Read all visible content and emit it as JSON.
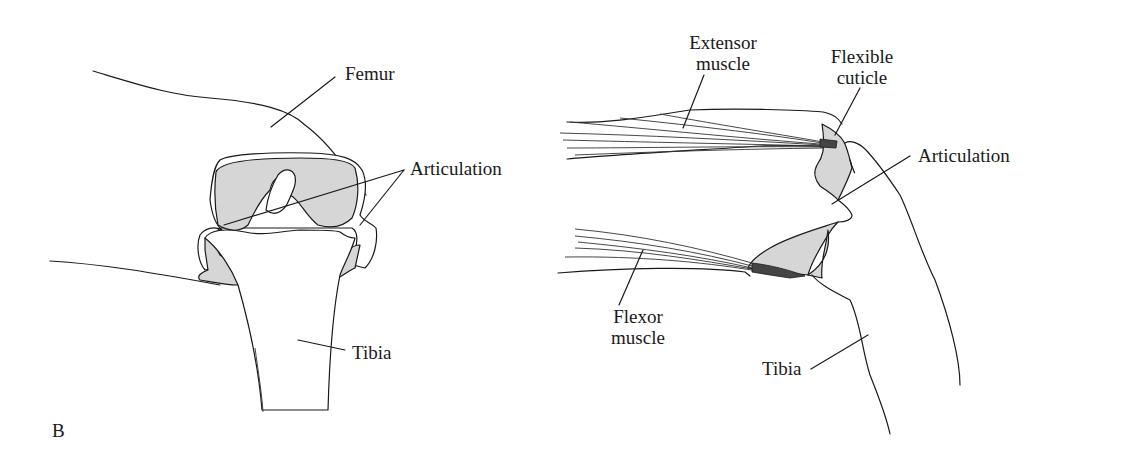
{
  "figure": {
    "panel_letter": "B",
    "left_panel": {
      "description": "Cross-section of femur-tibia joint",
      "labels": {
        "femur": "Femur",
        "articulation": "Articulation",
        "tibia": "Tibia"
      }
    },
    "right_panel": {
      "description": "Side view of femur-tibia joint with muscles",
      "labels": {
        "extensor_line1": "Extensor",
        "extensor_line2": "muscle",
        "flexible_line1": "Flexible",
        "flexible_line2": "cuticle",
        "articulation": "Articulation",
        "flexor_line1": "Flexor",
        "flexor_line2": "muscle",
        "tibia": "Tibia"
      }
    },
    "colors": {
      "line": "#1a1a1a",
      "shading": "#d6d6d6",
      "background": "#ffffff"
    }
  }
}
